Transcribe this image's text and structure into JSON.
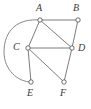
{
  "figure": {
    "type": "graph-diagram",
    "title": "",
    "background_color": "#ffffff",
    "edge_color": "#5a5a5a",
    "vertex_fill_color": "#ffffff",
    "vertex_stroke_color": "#4a4a4a",
    "label_color": "#3a3a3a"
  },
  "vertices": [
    {
      "id": "A",
      "label": "A",
      "x": 40,
      "y": 20,
      "label_x": 36,
      "label_y": 3
    },
    {
      "id": "B",
      "label": "B",
      "x": 78,
      "y": 20,
      "label_x": 73,
      "label_y": 3
    },
    {
      "id": "C",
      "label": "C",
      "x": 28,
      "y": 48,
      "label_x": 13,
      "label_y": 42
    },
    {
      "id": "D",
      "label": "D",
      "x": 72,
      "y": 48,
      "label_x": 78,
      "label_y": 43
    },
    {
      "id": "E",
      "label": "E",
      "x": 31,
      "y": 82,
      "label_x": 27,
      "label_y": 88
    },
    {
      "id": "F",
      "label": "F",
      "x": 64,
      "y": 82,
      "label_x": 60,
      "label_y": 88
    }
  ],
  "edges": [
    {
      "id": "edge-A-B",
      "from": "A",
      "to": "B",
      "shape": "straight"
    },
    {
      "id": "edge-A-C",
      "from": "A",
      "to": "C",
      "shape": "straight"
    },
    {
      "id": "edge-A-D",
      "from": "A",
      "to": "D",
      "shape": "straight"
    },
    {
      "id": "edge-B-D",
      "from": "B",
      "to": "D",
      "shape": "straight"
    },
    {
      "id": "edge-C-D",
      "from": "C",
      "to": "D",
      "shape": "straight"
    },
    {
      "id": "edge-C-E",
      "from": "C",
      "to": "E",
      "shape": "straight"
    },
    {
      "id": "edge-C-F",
      "from": "C",
      "to": "F",
      "shape": "straight"
    },
    {
      "id": "edge-D-F",
      "from": "D",
      "to": "F",
      "shape": "straight"
    },
    {
      "id": "edge-A-E-arc",
      "from": "A",
      "to": "E",
      "shape": "arc",
      "bulge_direction": "left"
    }
  ]
}
